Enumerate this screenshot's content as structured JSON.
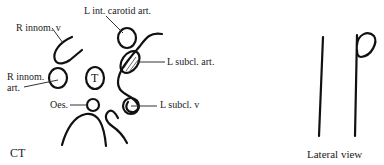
{
  "ct_panel": {
    "caption": "CT",
    "labels": {
      "r_innom_v": "R innom. v",
      "l_int_carotid_art": "L int. carotid art.",
      "l_subcl_art": "L subcl. art.",
      "r_innom_art_line1": "R innom.",
      "r_innom_art_line2": "art.",
      "trachea": "T",
      "oesophagus": "Oes.",
      "l_subcl_v": "L subcl. v"
    }
  },
  "lateral_panel": {
    "caption": "Lateral view"
  }
}
